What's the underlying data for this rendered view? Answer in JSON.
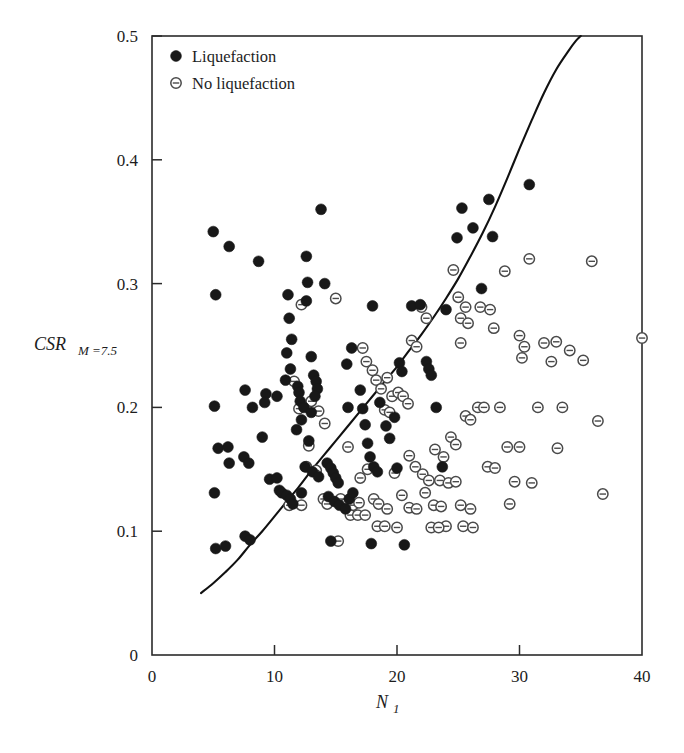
{
  "chart_data": {
    "type": "scatter",
    "title": "",
    "xlabel": "N_1",
    "xlabel_main": "N",
    "xlabel_sub": "1",
    "ylabel": "CSR M=7.5",
    "ylabel_main": "CSR",
    "ylabel_sub": "M =7.5",
    "xlim": [
      0,
      40
    ],
    "ylim": [
      0,
      0.5
    ],
    "xticks": [
      0,
      10,
      20,
      30,
      40
    ],
    "xtick_labels": [
      "0",
      "10",
      "20",
      "30",
      "40"
    ],
    "yticks": [
      0,
      0.1,
      0.2,
      0.3,
      0.4,
      0.5
    ],
    "ytick_labels": [
      "0",
      "0.1",
      "0.2",
      "0.3",
      "0.4",
      "0.5"
    ],
    "grid": false,
    "legend_position": "top-left",
    "legend": [
      {
        "label": "Liquefaction",
        "marker": "filled-circle",
        "color": "#181818"
      },
      {
        "label": "No liquefaction",
        "marker": "circle-with-bar",
        "color": "#4a4a4a"
      }
    ],
    "series": [
      {
        "name": "Liquefaction",
        "marker": "filled-circle",
        "color": "#181818",
        "points": [
          [
            5.0,
            0.342
          ],
          [
            5.2,
            0.291
          ],
          [
            6.3,
            0.33
          ],
          [
            5.1,
            0.201
          ],
          [
            5.4,
            0.167
          ],
          [
            6.2,
            0.168
          ],
          [
            6.3,
            0.155
          ],
          [
            5.1,
            0.131
          ],
          [
            5.2,
            0.086
          ],
          [
            6.0,
            0.088
          ],
          [
            7.6,
            0.214
          ],
          [
            7.5,
            0.16
          ],
          [
            7.9,
            0.155
          ],
          [
            7.6,
            0.096
          ],
          [
            8.0,
            0.093
          ],
          [
            8.7,
            0.318
          ],
          [
            9.3,
            0.211
          ],
          [
            9.2,
            0.204
          ],
          [
            9.0,
            0.176
          ],
          [
            9.6,
            0.142
          ],
          [
            10.2,
            0.143
          ],
          [
            10.4,
            0.133
          ],
          [
            10.6,
            0.131
          ],
          [
            11.0,
            0.129
          ],
          [
            11.3,
            0.126
          ],
          [
            11.5,
            0.122
          ],
          [
            10.2,
            0.209
          ],
          [
            10.9,
            0.222
          ],
          [
            11.1,
            0.291
          ],
          [
            11.2,
            0.272
          ],
          [
            11.4,
            0.255
          ],
          [
            11.0,
            0.244
          ],
          [
            11.3,
            0.231
          ],
          [
            11.9,
            0.217
          ],
          [
            12.0,
            0.212
          ],
          [
            12.1,
            0.205
          ],
          [
            12.4,
            0.2
          ],
          [
            12.2,
            0.19
          ],
          [
            11.8,
            0.182
          ],
          [
            12.6,
            0.322
          ],
          [
            12.7,
            0.301
          ],
          [
            12.6,
            0.286
          ],
          [
            13.0,
            0.241
          ],
          [
            13.2,
            0.226
          ],
          [
            13.4,
            0.221
          ],
          [
            13.5,
            0.215
          ],
          [
            13.3,
            0.209
          ],
          [
            13.0,
            0.196
          ],
          [
            12.8,
            0.173
          ],
          [
            12.5,
            0.152
          ],
          [
            13.1,
            0.148
          ],
          [
            13.6,
            0.144
          ],
          [
            12.2,
            0.131
          ],
          [
            13.8,
            0.36
          ],
          [
            14.1,
            0.3
          ],
          [
            14.3,
            0.155
          ],
          [
            14.6,
            0.151
          ],
          [
            14.8,
            0.147
          ],
          [
            15.0,
            0.143
          ],
          [
            15.2,
            0.139
          ],
          [
            14.4,
            0.128
          ],
          [
            14.9,
            0.124
          ],
          [
            15.3,
            0.121
          ],
          [
            15.8,
            0.118
          ],
          [
            16.1,
            0.126
          ],
          [
            16.4,
            0.131
          ],
          [
            16.0,
            0.2
          ],
          [
            15.9,
            0.235
          ],
          [
            16.3,
            0.248
          ],
          [
            17.0,
            0.214
          ],
          [
            17.2,
            0.199
          ],
          [
            17.4,
            0.186
          ],
          [
            17.6,
            0.171
          ],
          [
            17.8,
            0.16
          ],
          [
            18.1,
            0.152
          ],
          [
            18.4,
            0.148
          ],
          [
            18.0,
            0.282
          ],
          [
            18.6,
            0.204
          ],
          [
            19.1,
            0.185
          ],
          [
            19.4,
            0.175
          ],
          [
            19.8,
            0.192
          ],
          [
            20.2,
            0.236
          ],
          [
            20.4,
            0.229
          ],
          [
            20.0,
            0.151
          ],
          [
            21.2,
            0.282
          ],
          [
            21.9,
            0.283
          ],
          [
            22.4,
            0.237
          ],
          [
            22.6,
            0.231
          ],
          [
            22.8,
            0.226
          ],
          [
            23.2,
            0.2
          ],
          [
            24.9,
            0.337
          ],
          [
            25.3,
            0.361
          ],
          [
            26.2,
            0.345
          ],
          [
            26.9,
            0.296
          ],
          [
            27.5,
            0.368
          ],
          [
            27.8,
            0.338
          ],
          [
            30.8,
            0.38
          ],
          [
            24.0,
            0.279
          ],
          [
            23.7,
            0.152
          ],
          [
            20.6,
            0.089
          ],
          [
            17.9,
            0.09
          ],
          [
            14.6,
            0.092
          ],
          [
            8.2,
            0.2
          ]
        ]
      },
      {
        "name": "No liquefaction",
        "marker": "circle-with-bar",
        "color": "#4a4a4a",
        "points": [
          [
            12.2,
            0.283
          ],
          [
            15.0,
            0.288
          ],
          [
            11.6,
            0.221
          ],
          [
            13.0,
            0.205
          ],
          [
            12.0,
            0.199
          ],
          [
            13.6,
            0.197
          ],
          [
            14.1,
            0.187
          ],
          [
            12.8,
            0.169
          ],
          [
            12.6,
            0.152
          ],
          [
            13.4,
            0.149
          ],
          [
            14.0,
            0.126
          ],
          [
            14.3,
            0.122
          ],
          [
            11.2,
            0.121
          ],
          [
            12.2,
            0.121
          ],
          [
            15.4,
            0.126
          ],
          [
            15.8,
            0.122
          ],
          [
            16.4,
            0.121
          ],
          [
            16.9,
            0.123
          ],
          [
            16.2,
            0.113
          ],
          [
            16.8,
            0.113
          ],
          [
            17.4,
            0.113
          ],
          [
            15.2,
            0.092
          ],
          [
            17.0,
            0.143
          ],
          [
            17.6,
            0.15
          ],
          [
            18.1,
            0.126
          ],
          [
            18.5,
            0.122
          ],
          [
            17.2,
            0.248
          ],
          [
            17.5,
            0.237
          ],
          [
            18.0,
            0.23
          ],
          [
            18.3,
            0.222
          ],
          [
            18.7,
            0.215
          ],
          [
            19.2,
            0.224
          ],
          [
            19.6,
            0.209
          ],
          [
            19.0,
            0.198
          ],
          [
            19.4,
            0.196
          ],
          [
            20.1,
            0.212
          ],
          [
            20.5,
            0.209
          ],
          [
            20.9,
            0.203
          ],
          [
            21.2,
            0.254
          ],
          [
            21.6,
            0.249
          ],
          [
            22.0,
            0.281
          ],
          [
            22.4,
            0.272
          ],
          [
            21.0,
            0.161
          ],
          [
            21.5,
            0.152
          ],
          [
            22.1,
            0.146
          ],
          [
            22.6,
            0.141
          ],
          [
            23.1,
            0.166
          ],
          [
            23.5,
            0.141
          ],
          [
            19.8,
            0.147
          ],
          [
            20.4,
            0.129
          ],
          [
            21.0,
            0.119
          ],
          [
            21.6,
            0.118
          ],
          [
            22.3,
            0.131
          ],
          [
            23.0,
            0.121
          ],
          [
            23.6,
            0.12
          ],
          [
            24.2,
            0.139
          ],
          [
            24.8,
            0.14
          ],
          [
            25.2,
            0.121
          ],
          [
            24.4,
            0.176
          ],
          [
            24.8,
            0.17
          ],
          [
            25.6,
            0.193
          ],
          [
            26.0,
            0.19
          ],
          [
            26.6,
            0.2
          ],
          [
            27.1,
            0.2
          ],
          [
            25.0,
            0.289
          ],
          [
            25.2,
            0.272
          ],
          [
            25.6,
            0.281
          ],
          [
            25.8,
            0.268
          ],
          [
            25.2,
            0.252
          ],
          [
            26.8,
            0.281
          ],
          [
            27.6,
            0.279
          ],
          [
            27.9,
            0.264
          ],
          [
            24.6,
            0.311
          ],
          [
            28.8,
            0.31
          ],
          [
            30.8,
            0.32
          ],
          [
            33.0,
            0.253
          ],
          [
            34.1,
            0.246
          ],
          [
            35.2,
            0.238
          ],
          [
            30.0,
            0.258
          ],
          [
            30.4,
            0.249
          ],
          [
            30.2,
            0.24
          ],
          [
            32.0,
            0.252
          ],
          [
            32.6,
            0.237
          ],
          [
            35.9,
            0.318
          ],
          [
            31.5,
            0.2
          ],
          [
            33.5,
            0.2
          ],
          [
            30.0,
            0.168
          ],
          [
            33.1,
            0.167
          ],
          [
            29.6,
            0.14
          ],
          [
            31.0,
            0.139
          ],
          [
            36.4,
            0.189
          ],
          [
            40.0,
            0.256
          ],
          [
            27.4,
            0.152
          ],
          [
            28.0,
            0.151
          ],
          [
            29.2,
            0.122
          ],
          [
            26.0,
            0.118
          ],
          [
            23.8,
            0.16
          ],
          [
            24.0,
            0.104
          ],
          [
            25.4,
            0.104
          ],
          [
            26.2,
            0.103
          ],
          [
            22.8,
            0.103
          ],
          [
            23.4,
            0.103
          ],
          [
            19.2,
            0.118
          ],
          [
            20.0,
            0.103
          ],
          [
            18.4,
            0.104
          ],
          [
            19.0,
            0.104
          ],
          [
            16.0,
            0.168
          ],
          [
            28.4,
            0.2
          ],
          [
            29.0,
            0.168
          ],
          [
            36.8,
            0.13
          ]
        ]
      }
    ],
    "boundary_curve": {
      "name": "liquefaction-boundary",
      "color": "#111111",
      "points": [
        [
          4.0,
          0.05
        ],
        [
          5.0,
          0.058
        ],
        [
          6.0,
          0.067
        ],
        [
          7.0,
          0.077
        ],
        [
          8.0,
          0.089
        ],
        [
          9.0,
          0.1
        ],
        [
          10.0,
          0.112
        ],
        [
          11.0,
          0.124
        ],
        [
          12.0,
          0.136
        ],
        [
          13.0,
          0.149
        ],
        [
          14.0,
          0.161
        ],
        [
          15.0,
          0.173
        ],
        [
          16.0,
          0.185
        ],
        [
          17.0,
          0.197
        ],
        [
          18.0,
          0.209
        ],
        [
          19.0,
          0.221
        ],
        [
          20.0,
          0.233
        ],
        [
          21.0,
          0.246
        ],
        [
          22.0,
          0.259
        ],
        [
          23.0,
          0.273
        ],
        [
          24.0,
          0.288
        ],
        [
          25.0,
          0.304
        ],
        [
          26.0,
          0.322
        ],
        [
          27.0,
          0.341
        ],
        [
          28.0,
          0.362
        ],
        [
          29.0,
          0.385
        ],
        [
          30.0,
          0.409
        ],
        [
          31.0,
          0.432
        ],
        [
          32.0,
          0.454
        ],
        [
          33.0,
          0.473
        ],
        [
          34.0,
          0.488
        ],
        [
          34.6,
          0.496
        ],
        [
          35.0,
          0.5
        ]
      ]
    }
  }
}
